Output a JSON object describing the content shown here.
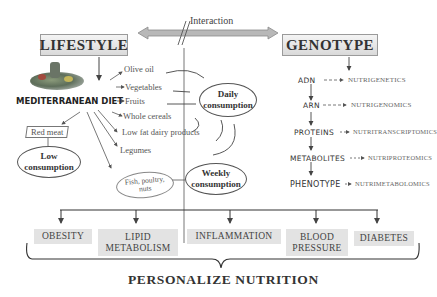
{
  "header": {
    "lifestyle_label": "LIFESTYLE",
    "genotype_label": "GENOTYPE",
    "interaction_label": "Interaction"
  },
  "lifestyle": {
    "diet_title": "MEDITERRANEAN DIET",
    "daily_foods": [
      "Olive oil",
      "Vegetables",
      "Fruits",
      "Whole cereals",
      "Low fat dairy products",
      "Legumes"
    ],
    "weekly_foods_label": "Fish, poultry, nuts",
    "weekly_foods_lines": [
      "Fish, poultry,",
      "nuts"
    ],
    "low_foods_label": "Red meat",
    "daily_consumption": [
      "Daily",
      "consumption"
    ],
    "weekly_consumption": [
      "Weekly",
      "consumption"
    ],
    "low_consumption": [
      "Low",
      "consumption"
    ],
    "image_icon": "food-basket-image"
  },
  "genotype": {
    "levels": [
      {
        "name": "ADN",
        "omics": "NUTRIGENETICS"
      },
      {
        "name": "ARN",
        "omics": "NUTRIGENOMICS"
      },
      {
        "name": "PROTEINS",
        "omics": "NUTRITRANSCRIPTOMICS"
      },
      {
        "name": "METABOLITES",
        "omics": "NUTRIPROTEOMICS"
      },
      {
        "name": "PHENOTYPE",
        "omics": "NUTRIMETABOLOMICS"
      }
    ]
  },
  "outcomes": [
    {
      "lines": [
        "OBESITY"
      ]
    },
    {
      "lines": [
        "LIPID",
        "METABOLISM"
      ]
    },
    {
      "lines": [
        "INFLAMMATION"
      ]
    },
    {
      "lines": [
        "BLOOD",
        "PRESSURE"
      ]
    },
    {
      "lines": [
        "DIABETES"
      ]
    }
  ],
  "footer": {
    "title": "PERSONALIZE NUTRITION"
  },
  "colors": {
    "header_box_top": "#f4f4f4",
    "header_box_bottom": "#d9d9d9",
    "outcome_bg": "#e3e3e3",
    "arrow_fill": "#b8b8b8",
    "line": "#444444"
  }
}
